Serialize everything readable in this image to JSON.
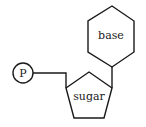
{
  "diagram": {
    "phosphate_label": "P",
    "sugar_label": "sugar",
    "base_label": "base"
  },
  "colors": {
    "stroke": "#1a1a1a",
    "background": "#ffffff"
  }
}
